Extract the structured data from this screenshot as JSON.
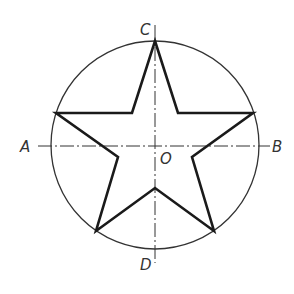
{
  "diagram": {
    "colors": {
      "line": "#1a1a1a",
      "circle": "#333333",
      "axis": "#333333",
      "label": "#333333",
      "background": "#ffffff"
    },
    "circle": {
      "cx": 155,
      "cy": 145,
      "r": 104
    },
    "axes": {
      "horizontal": {
        "x1": 38,
        "y1": 146,
        "x2": 270,
        "y2": 146,
        "style": "dash-dot"
      },
      "vertical": {
        "x1": 155,
        "y1": 25,
        "x2": 155,
        "y2": 263,
        "style": "dash-dot"
      }
    },
    "star": {
      "outer_points": [
        [
          155,
          41
        ],
        [
          253,
          113
        ],
        [
          214,
          231
        ],
        [
          96,
          231
        ],
        [
          56,
          113
        ]
      ],
      "inner_points": [
        [
          178,
          113
        ],
        [
          192,
          157
        ],
        [
          155,
          188
        ],
        [
          118,
          157
        ],
        [
          132,
          113
        ]
      ]
    },
    "labels": {
      "A": "A",
      "B": "B",
      "C": "C",
      "D": "D",
      "O": "O"
    }
  }
}
